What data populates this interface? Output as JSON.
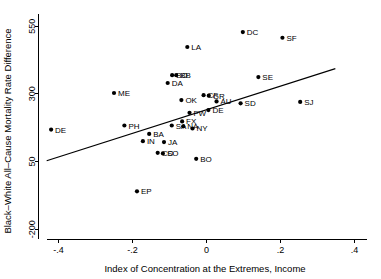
{
  "chart_data": {
    "type": "scatter",
    "title": "",
    "xlabel": "Index of Concentration at the Extremes, Income",
    "ylabel": "Black–White All–Cause Mortality Rate Difference",
    "xlim": [
      -0.45,
      0.42
    ],
    "ylim": [
      -225,
      580
    ],
    "xticks": [
      -0.4,
      -0.2,
      0,
      0.2,
      0.4
    ],
    "xtick_labels": [
      "-.4",
      "-.2",
      "0",
      ".2",
      ".4"
    ],
    "yticks": [
      -200,
      50,
      300,
      550
    ],
    "ytick_labels": [
      "-200",
      "50",
      "300",
      "550"
    ],
    "grid": false,
    "legend": "none",
    "marker_color": "#000000",
    "line_color": "#000000",
    "points": [
      {
        "label": "DC",
        "x": 0.098,
        "y": 528
      },
      {
        "label": "SF",
        "x": 0.205,
        "y": 507
      },
      {
        "label": "LA",
        "x": -0.052,
        "y": 473
      },
      {
        "label": "BB",
        "x": -0.093,
        "y": 369
      },
      {
        "label": "BO",
        "x": -0.082,
        "y": 369
      },
      {
        "label": "SE",
        "x": 0.14,
        "y": 362
      },
      {
        "label": "DA",
        "x": -0.105,
        "y": 340
      },
      {
        "label": "ME",
        "x": -0.25,
        "y": 303
      },
      {
        "label": "CF",
        "x": -0.008,
        "y": 295
      },
      {
        "label": "GR",
        "x": 0.006,
        "y": 293
      },
      {
        "label": "OK",
        "x": -0.068,
        "y": 277
      },
      {
        "label": "AU",
        "x": 0.027,
        "y": 272
      },
      {
        "label": "SD",
        "x": 0.092,
        "y": 265
      },
      {
        "label": "SJ",
        "x": 0.253,
        "y": 270
      },
      {
        "label": "DE",
        "x": 0.005,
        "y": 240
      },
      {
        "label": "FW",
        "x": -0.046,
        "y": 230
      },
      {
        "label": "FX",
        "x": -0.066,
        "y": 198
      },
      {
        "label": "PH",
        "x": -0.222,
        "y": 183
      },
      {
        "label": "SA",
        "x": -0.094,
        "y": 183
      },
      {
        "label": "NA",
        "x": -0.063,
        "y": 180
      },
      {
        "label": "NY",
        "x": -0.038,
        "y": 172
      },
      {
        "label": "BA",
        "x": -0.155,
        "y": 152
      },
      {
        "label": "DE2",
        "x": -0.42,
        "y": 168
      },
      {
        "label": "IN",
        "x": -0.172,
        "y": 125
      },
      {
        "label": "JA",
        "x": -0.115,
        "y": 122
      },
      {
        "label": "CO",
        "x": -0.132,
        "y": 82
      },
      {
        "label": "SO",
        "x": -0.118,
        "y": 80
      },
      {
        "label": "BO2",
        "x": -0.028,
        "y": 60
      },
      {
        "label": "EP",
        "x": -0.188,
        "y": -60
      }
    ],
    "fit_line": {
      "x1": -0.432,
      "y1": 53,
      "x2": 0.348,
      "y2": 393
    }
  },
  "point_labels": {
    "DC": "DC",
    "SF": "SF",
    "LA": "LA",
    "BB": "BO",
    "BO": "BB",
    "SE": "SE",
    "DA": "DA",
    "ME": "ME",
    "CF": "CF",
    "GR": "GR",
    "OK": "OK",
    "AU": "AU",
    "SD": "SD",
    "SJ": "SJ",
    "DE": "DE",
    "FW": "FW",
    "FX": "FX",
    "PH": "PH",
    "SA": "SA",
    "NA": "NA",
    "NY": "NY",
    "BA": "BA",
    "DE2": "DE",
    "IN": "IN",
    "JA": "JA",
    "CO": "CO",
    "SO": "SO",
    "BO2": "BO",
    "EP": "EP"
  }
}
